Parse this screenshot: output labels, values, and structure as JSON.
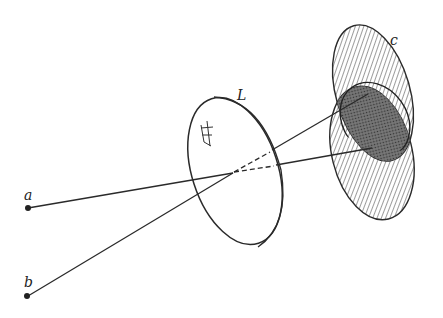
{
  "figure": {
    "labels": {
      "lens": "L",
      "image_plane": "c",
      "point_a": "a",
      "point_b": "b"
    },
    "colors": {
      "stroke": "#2a2a2a",
      "hatch": "#555555",
      "overlap": "#3a3a3a",
      "background": "#ffffff"
    }
  }
}
